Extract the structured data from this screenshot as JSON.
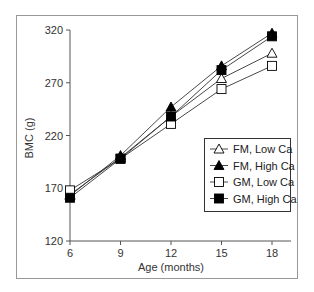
{
  "chart_data": {
    "type": "line",
    "title": "",
    "xlabel": "Age (months)",
    "ylabel": "BMC (g)",
    "x": [
      6,
      9,
      12,
      15,
      18
    ],
    "xticks": [
      "6",
      "9",
      "12",
      "15",
      "18"
    ],
    "yticks": [
      "120",
      "170",
      "220",
      "270",
      "320"
    ],
    "ylim": [
      120,
      320
    ],
    "xlim": [
      6,
      18
    ],
    "grid": false,
    "legend_position": "lower right (inside plot)",
    "series": [
      {
        "name": "FM, Low Ca",
        "marker": "open-triangle",
        "values": [
          164,
          199,
          238,
          274,
          298
        ]
      },
      {
        "name": "FM, High Ca",
        "marker": "filled-triangle",
        "values": [
          163,
          201,
          247,
          286,
          317
        ]
      },
      {
        "name": "GM, Low Ca",
        "marker": "open-square",
        "values": [
          168,
          198,
          231,
          264,
          286
        ]
      },
      {
        "name": "GM, High Ca",
        "marker": "filled-square",
        "values": [
          161,
          198,
          238,
          282,
          314
        ]
      }
    ]
  },
  "colors": {
    "line": "#333333",
    "frame": "#888888",
    "axis": "#555555",
    "marker_fill": "#000000"
  }
}
